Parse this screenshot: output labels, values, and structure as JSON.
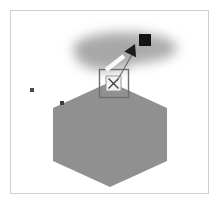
{
  "figure": {
    "canvas": {
      "width": 219,
      "height": 204,
      "background_color": "#ffffff"
    },
    "frame": {
      "name": "image-border",
      "x": 10,
      "y": 10,
      "width": 199,
      "height": 184,
      "stroke_color": "#cfcfcf",
      "stroke_width": 1,
      "fill_color": "#ffffff"
    },
    "shapes": {
      "hexagon": {
        "label": "hexagon-region",
        "fill_color": "#909090",
        "center_x": 110,
        "center_y": 134,
        "points": "110,82 167,108 167,161 110,187 53,161 53,108",
        "opacity": 1
      },
      "blur_blob": {
        "label": "blurred-cloud-region",
        "fill_color": "#a8a8a8",
        "center_x": 125,
        "center_y": 48,
        "radius_x": 52,
        "radius_y": 16,
        "blur_std_dev": 6,
        "opacity": 0.95
      }
    },
    "markers": {
      "callout_box": {
        "label": "callout-selection-box",
        "x": 99,
        "y": 69,
        "width": 29,
        "height": 28,
        "stroke_color": "#6f6f6f",
        "stroke_width": 1.4,
        "fill_color": "none"
      },
      "target_chip": {
        "label": "target-chip",
        "x": 106,
        "y": 76,
        "width": 15,
        "height": 15,
        "fill_color": "#f2f2f2",
        "stroke_color": "#9a9a9a",
        "stroke_width": 1,
        "cross_color": "#3a3a3a",
        "cross_width": 1.2
      },
      "leader_line": {
        "label": "leader-line",
        "x1": 117,
        "y1": 81,
        "x2": 134,
        "y2": 51,
        "stroke_color": "#6b6b6b",
        "stroke_width": 1.2
      },
      "arrow_head": {
        "label": "arrow-head",
        "points": "135,44 141,56 128,55",
        "fill_color": "#1c1c1c",
        "rotation_deg": 22
      },
      "white_bar": {
        "label": "white-crossbar",
        "x1": 106,
        "y1": 70,
        "x2": 124,
        "y2": 56,
        "stroke_color": "#fbfbfb",
        "stroke_width": 4.5
      },
      "black_square": {
        "label": "black-square-marker",
        "x": 139,
        "y": 34,
        "width": 12,
        "height": 12,
        "fill_color": "#141414"
      },
      "dots": [
        {
          "label": "dot-marker-left",
          "x": 30,
          "y": 88,
          "width": 4,
          "height": 4,
          "fill_color": "#4a4a4a"
        },
        {
          "label": "dot-marker-edge",
          "x": 60,
          "y": 101,
          "width": 4,
          "height": 4,
          "fill_color": "#3d3d3d"
        }
      ]
    }
  }
}
